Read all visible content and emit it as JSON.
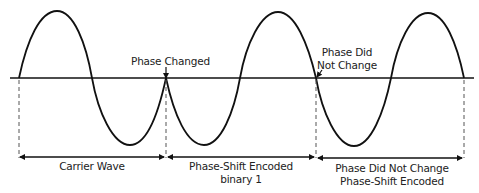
{
  "diagram": {
    "annotations": {
      "phase_changed": "Phase Changed",
      "phase_did_not_change_line1": "Phase Did",
      "phase_did_not_change_line2": "Not Change"
    },
    "segments": [
      {
        "label_line1": "Carrier Wave",
        "label_line2": ""
      },
      {
        "label_line1": "Phase-Shift Encoded",
        "label_line2": "binary 1"
      },
      {
        "label_line1": "Phase Did Not Change",
        "label_line2": "Phase-Shift Encoded"
      }
    ],
    "colors": {
      "stroke": "#111111",
      "dash": "#555555",
      "text": "#222222"
    }
  }
}
